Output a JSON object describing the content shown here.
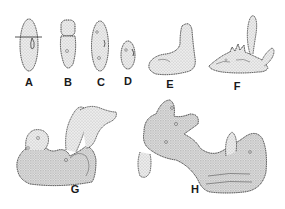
{
  "figure": {
    "panels": [
      {
        "id": "A",
        "label": "A",
        "label_pos": [
          29,
          77
        ]
      },
      {
        "id": "B",
        "label": "B",
        "label_pos": [
          68,
          77
        ]
      },
      {
        "id": "C",
        "label": "C",
        "label_pos": [
          101,
          77
        ]
      },
      {
        "id": "D",
        "label": "D",
        "label_pos": [
          128,
          76
        ]
      },
      {
        "id": "E",
        "label": "E",
        "label_pos": [
          170,
          79
        ]
      },
      {
        "id": "F",
        "label": "F",
        "label_pos": [
          237,
          81
        ]
      },
      {
        "id": "G",
        "label": "G",
        "label_pos": [
          75,
          184
        ]
      },
      {
        "id": "H",
        "label": "H",
        "label_pos": [
          195,
          184
        ]
      }
    ],
    "colors": {
      "outline": "#2a2a2a",
      "fill": "#e6e6e6",
      "stipple": "#8a8a8a",
      "background": "#ffffff"
    }
  }
}
